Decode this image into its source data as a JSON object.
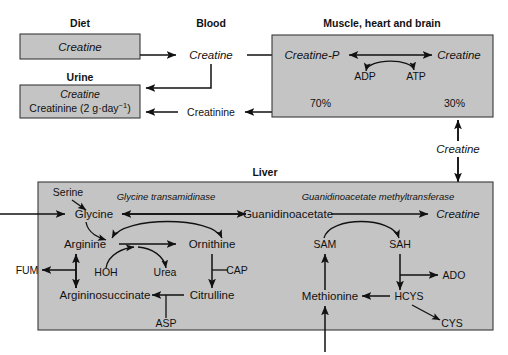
{
  "figure": {
    "type": "biochemical-pathway-diagram"
  },
  "compartments": {
    "diet": {
      "label": "Diet",
      "box_contents": [
        "Creatine"
      ]
    },
    "urine": {
      "label": "Urine",
      "box_contents": [
        "Creatine",
        "Creatinine (2 g·day⁻¹)"
      ],
      "creatinine_base": "Creatinine (2 g·day",
      "creatinine_sup": "−1",
      "creatinine_tail": ")"
    },
    "blood": {
      "label": "Blood",
      "nodes": [
        "Creatine",
        "Creatinine"
      ]
    },
    "muscle": {
      "label": "Muscle, heart and brain",
      "nodes": [
        "Creatine-P",
        "Creatine",
        "ADP",
        "ATP"
      ],
      "percentages": [
        "70%",
        "30%"
      ]
    },
    "liver": {
      "label": "Liver",
      "enzymes": [
        "Glycine transamidinase",
        "Guanidinoacetate methyltransferase"
      ],
      "nodes": [
        "Serine",
        "Glycine",
        "Guanidinoacetate",
        "Creatine",
        "Arginine",
        "Ornithine",
        "FUM",
        "HOH",
        "Urea",
        "CAP",
        "Argininosuccinate",
        "Citrulline",
        "ASP",
        "SAM",
        "SAH",
        "ADO",
        "Methionine",
        "HCYS",
        "CYS"
      ]
    }
  },
  "transport": {
    "interorgan_creatine_label": "Creatine"
  },
  "colors": {
    "box_fill": "#c4c4c4",
    "box_stroke": "#3a3a3a",
    "line": "#111111",
    "background": "#ffffff"
  }
}
